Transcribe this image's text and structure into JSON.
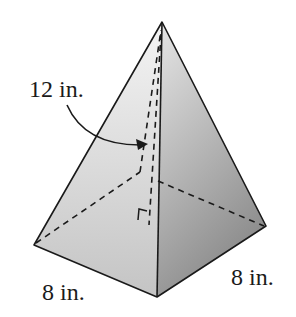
{
  "figure": {
    "type": "square pyramid",
    "labels": {
      "height": "12 in.",
      "base_left": "8 in.",
      "base_right": "8 in."
    },
    "colors": {
      "stroke": "#1a1a1a",
      "left_face_top": "#f4f4f4",
      "left_face_bottom": "#c4c4c4",
      "right_face_top": "#e6e6e6",
      "right_face_bottom": "#8c8c8c"
    }
  }
}
